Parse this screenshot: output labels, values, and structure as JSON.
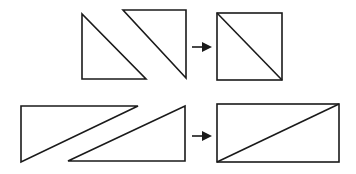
{
  "diagram": {
    "rows": [
      {
        "name": "square-composition",
        "inputs": [
          {
            "name": "triangle-lower-left",
            "points": [
              [
                82,
                14
              ],
              [
                82,
                79
              ],
              [
                146,
                79
              ]
            ]
          },
          {
            "name": "triangle-upper-right",
            "points": [
              [
                123,
                10
              ],
              [
                186,
                10
              ],
              [
                186,
                78
              ]
            ]
          }
        ],
        "arrow": {
          "x1": 192,
          "x2": 212,
          "y": 47
        },
        "result": {
          "name": "square",
          "x": 217,
          "y": 13,
          "w": 65,
          "h": 67,
          "diagonal": "top-left-to-bottom-right"
        }
      },
      {
        "name": "rectangle-composition",
        "inputs": [
          {
            "name": "triangle-upper-left",
            "points": [
              [
                21,
                106
              ],
              [
                138,
                106
              ],
              [
                21,
                162
              ]
            ]
          },
          {
            "name": "triangle-lower-right",
            "points": [
              [
                185,
                106
              ],
              [
                185,
                161
              ],
              [
                68,
                161
              ]
            ]
          }
        ],
        "arrow": {
          "x1": 192,
          "x2": 212,
          "y": 136
        },
        "result": {
          "name": "rectangle",
          "x": 217,
          "y": 104,
          "w": 122,
          "h": 58,
          "diagonal": "bottom-left-to-top-right"
        }
      }
    ],
    "colors": {
      "stroke": "#1a1a1a",
      "background": "#ffffff"
    }
  }
}
